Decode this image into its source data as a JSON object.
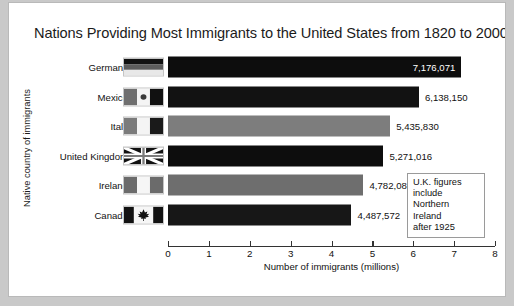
{
  "chart_data": {
    "type": "bar",
    "orientation": "horizontal",
    "title": "Nations Providing Most Immigrants to the United States from 1820 to 2000",
    "xlabel": "Number of immigrants (millions)",
    "ylabel": "Native country of immigrants",
    "xlim": [
      0,
      8
    ],
    "xticks": [
      "0",
      "1",
      "2",
      "3",
      "4",
      "5",
      "6",
      "7",
      "8"
    ],
    "grid": false,
    "legend": null,
    "categories": [
      "Germany",
      "Mexico",
      "Italy",
      "United Kingdom",
      "Ireland",
      "Canada"
    ],
    "values": [
      7176071,
      6138150,
      5435830,
      5271016,
      4782083,
      4487572
    ],
    "value_labels": [
      "7,176,071",
      "6,138,150",
      "5,435,830",
      "5,271,016",
      "4,782,083",
      "4,487,572"
    ],
    "bars": [
      {
        "category": "Germany",
        "value": 7176071,
        "label": "7,176,071",
        "color": "#0d0d0d",
        "label_position": "inside",
        "label_color": "#ffffff",
        "flag": "germany-flag"
      },
      {
        "category": "Mexico",
        "value": 6138150,
        "label": "6,138,150",
        "color": "#121212",
        "label_position": "outside",
        "label_color": "#111111",
        "flag": "mexico-flag"
      },
      {
        "category": "Italy",
        "value": 5435830,
        "label": "5,435,830",
        "color": "#7d7d7d",
        "label_position": "outside",
        "label_color": "#111111",
        "flag": "italy-flag"
      },
      {
        "category": "United Kingdom",
        "value": 5271016,
        "label": "5,271,016",
        "color": "#0d0d0d",
        "label_position": "outside",
        "label_color": "#111111",
        "flag": "united-kingdom-flag"
      },
      {
        "category": "Ireland",
        "value": 4782083,
        "label": "4,782,083",
        "color": "#6e6e6e",
        "label_position": "outside",
        "label_color": "#111111",
        "flag": "ireland-flag"
      },
      {
        "category": "Canada",
        "value": 4487572,
        "label": "4,487,572",
        "color": "#171717",
        "label_position": "outside",
        "label_color": "#111111",
        "flag": "canada-flag"
      }
    ],
    "annotation": {
      "lines": [
        "U.K. figures",
        "include",
        "Northern",
        "Ireland",
        "after 1925"
      ]
    }
  },
  "colors": {
    "page_background": "#ffffff",
    "outer_background": "#c9c9c9",
    "bar_dark": "#0d0d0d",
    "bar_gray": "#7d7d7d",
    "axis": "#333333",
    "text": "#111111"
  }
}
